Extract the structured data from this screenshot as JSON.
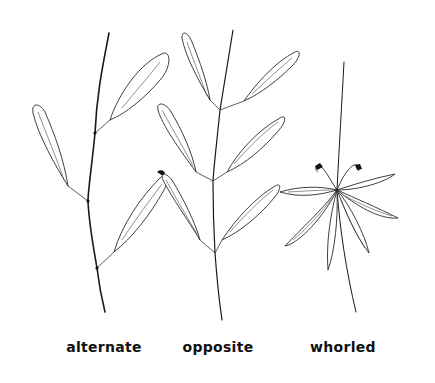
{
  "figure": {
    "background": "#ffffff",
    "ink_color": "#1a1a1a"
  },
  "panels": [
    {
      "id": "alternate",
      "label": "alternate",
      "label_x": 104
    },
    {
      "id": "opposite",
      "label": "opposite",
      "label_x": 218
    },
    {
      "id": "whorled",
      "label": "whorled",
      "label_x": 343
    }
  ]
}
